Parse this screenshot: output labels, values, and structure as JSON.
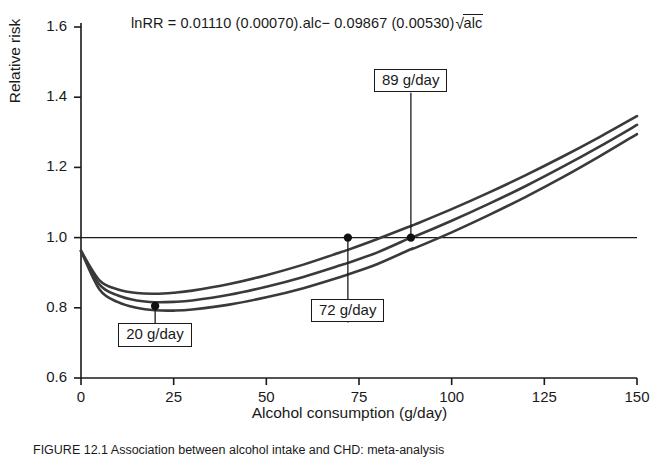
{
  "figure": {
    "equation_prefix": "lnRR = 0.01110 (0.00070).alc",
    "equation_middle": "− 0.09867 (0.00530)",
    "equation_radical_symbol": "√",
    "equation_radical_arg": "alc",
    "equation_full": "lnRR = 0.01110 (0.00070).alc− 0.09867 (0.00530)√alc",
    "caption": "FIGURE 12.1  Association between alcohol intake and CHD: meta-analysis"
  },
  "chart_data": {
    "type": "line",
    "title": "",
    "subtitle": "",
    "annotation_equation": "lnRR = 0.01110 (0.00070).alc− 0.09867 (0.00530)√alc",
    "xlabel": "Alcohol consumption (g/day)",
    "ylabel": "Relative risk",
    "xlim": [
      0,
      150
    ],
    "ylim": [
      0.6,
      1.6
    ],
    "xticks": [
      0,
      25,
      50,
      75,
      100,
      125,
      150
    ],
    "xtick_labels": [
      "0",
      "25",
      "50",
      "75",
      "100",
      "125",
      "150"
    ],
    "yticks": [
      0.6,
      0.8,
      1.0,
      1.2,
      1.4,
      1.6
    ],
    "ytick_labels": [
      "0.6",
      "0.8",
      "1.0",
      "1.2",
      "1.4",
      "1.6"
    ],
    "grid": false,
    "legend": "none",
    "reference_lines": [
      {
        "name": "null-risk-line",
        "axis": "y",
        "value": 1.0
      }
    ],
    "line_color": "#3a3a3a",
    "marker_color": "#111111",
    "x": [
      0,
      5,
      10,
      15,
      20,
      25,
      30,
      40,
      50,
      60,
      70,
      72,
      80,
      89,
      90,
      100,
      110,
      120,
      130,
      140,
      150
    ],
    "series": [
      {
        "name": "upper-confidence-limit",
        "values": [
          0.962,
          0.878,
          0.852,
          0.842,
          0.84,
          0.843,
          0.849,
          0.868,
          0.893,
          0.923,
          0.958,
          0.965,
          0.996,
          1.033,
          1.037,
          1.081,
          1.128,
          1.178,
          1.231,
          1.287,
          1.346
        ]
      },
      {
        "name": "central-estimate",
        "values": [
          0.962,
          0.866,
          0.835,
          0.821,
          0.816,
          0.817,
          0.821,
          0.837,
          0.86,
          0.888,
          0.921,
          0.928,
          0.958,
          1.0,
          1.003,
          1.048,
          1.096,
          1.147,
          1.202,
          1.26,
          1.321
        ]
      },
      {
        "name": "lower-confidence-limit",
        "values": [
          0.962,
          0.852,
          0.816,
          0.8,
          0.793,
          0.792,
          0.795,
          0.809,
          0.83,
          0.856,
          0.888,
          0.895,
          0.925,
          0.967,
          0.97,
          1.015,
          1.064,
          1.116,
          1.172,
          1.232,
          1.295
        ]
      }
    ],
    "annotations": [
      {
        "name": "nadir-20",
        "label": "20 g/day",
        "x": 20,
        "y": 0.805,
        "note": "minimum relative risk"
      },
      {
        "name": "crossing-72",
        "label": "72 g/day",
        "x": 72,
        "y": 1.0,
        "note": "upper limit crosses RR = 1"
      },
      {
        "name": "crossing-89",
        "label": "89 g/day",
        "x": 89,
        "y": 1.0,
        "note": "central estimate crosses RR = 1"
      }
    ],
    "markers": [
      {
        "x": 20,
        "y": 0.805
      },
      {
        "x": 72,
        "y": 1.0
      },
      {
        "x": 89,
        "y": 1.0
      }
    ]
  }
}
